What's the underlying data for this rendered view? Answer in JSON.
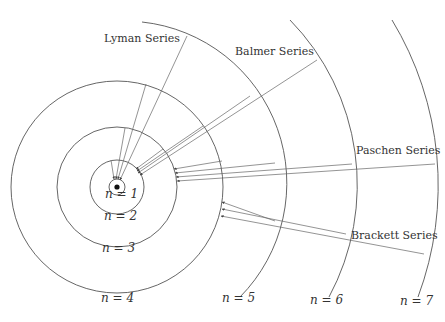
{
  "center": {
    "x": 117,
    "y": 187
  },
  "colors": {
    "line": "#555555",
    "text": "#333333",
    "nucleus": "#111111"
  },
  "levels": [
    {
      "n": 1,
      "label": "n = 1",
      "radius": 8,
      "type": "circle",
      "label_pos": {
        "x": 105,
        "y": 196
      }
    },
    {
      "n": 2,
      "label": "n = 2",
      "radius": 27,
      "type": "circle",
      "label_pos": {
        "x": 104,
        "y": 218
      }
    },
    {
      "n": 3,
      "label": "n = 3",
      "radius": 60,
      "type": "circle",
      "label_pos": {
        "x": 102,
        "y": 250
      }
    },
    {
      "n": 4,
      "label": "n = 4",
      "radius": 106,
      "type": "circle",
      "label_pos": {
        "x": 101,
        "y": 300
      }
    },
    {
      "n": 5,
      "label": "n = 5",
      "radius": 162,
      "type": "arc",
      "arc": {
        "x1": 142,
        "y1": 22,
        "x2": 240,
        "y2": 297
      },
      "label_pos": {
        "x": 222,
        "y": 300
      }
    },
    {
      "n": 6,
      "label": "n = 6",
      "radius": 236,
      "type": "arc",
      "arc": {
        "x1": 290,
        "y1": 20,
        "x2": 329,
        "y2": 297
      },
      "label_pos": {
        "x": 310,
        "y": 302
      }
    },
    {
      "n": 7,
      "label": "n = 7",
      "radius": 319,
      "type": "arc",
      "arc": {
        "x1": 392,
        "y1": 20,
        "x2": 418,
        "y2": 297
      },
      "label_pos": {
        "x": 400,
        "y": 303
      }
    }
  ],
  "series": [
    {
      "name": "Lyman Series",
      "final_level": 1,
      "label_pos": {
        "x": 104,
        "y": 40
      },
      "transitions": [
        {
          "from": 2,
          "x1": 111,
          "y1": 160,
          "x2": 114,
          "y2": 179
        },
        {
          "from": 3,
          "x1": 125,
          "y1": 128,
          "x2": 116,
          "y2": 179
        },
        {
          "from": 4,
          "x1": 146,
          "y1": 84,
          "x2": 118,
          "y2": 179
        },
        {
          "from": 5,
          "x1": 187,
          "y1": 36,
          "x2": 120,
          "y2": 180
        }
      ]
    },
    {
      "name": "Balmer Series",
      "final_level": 2,
      "label_pos": {
        "x": 235,
        "y": 53
      },
      "transitions": [
        {
          "from": 3,
          "x1": 163,
          "y1": 149,
          "x2": 136,
          "y2": 169
        },
        {
          "from": 4,
          "x1": 203,
          "y1": 126,
          "x2": 137,
          "y2": 171
        },
        {
          "from": 5,
          "x1": 250,
          "y1": 96,
          "x2": 138,
          "y2": 173
        },
        {
          "from": 6,
          "x1": 317,
          "y1": 60,
          "x2": 140,
          "y2": 175
        }
      ]
    },
    {
      "name": "Paschen Series",
      "final_level": 3,
      "label_pos": {
        "x": 356,
        "y": 152
      },
      "transitions": [
        {
          "from": 4,
          "x1": 222,
          "y1": 161,
          "x2": 174,
          "y2": 169
        },
        {
          "from": 5,
          "x1": 275,
          "y1": 163,
          "x2": 175,
          "y2": 173
        },
        {
          "from": 6,
          "x1": 352,
          "y1": 164,
          "x2": 176,
          "y2": 177
        },
        {
          "from": 7,
          "x1": 435,
          "y1": 164,
          "x2": 177,
          "y2": 181
        }
      ]
    },
    {
      "name": "Brackett Series",
      "final_level": 4,
      "label_pos": {
        "x": 351,
        "y": 237
      },
      "transitions": [
        {
          "from": 5,
          "x1": 275,
          "y1": 221,
          "x2": 222,
          "y2": 202
        },
        {
          "from": 6,
          "x1": 346,
          "y1": 234,
          "x2": 222,
          "y2": 209
        },
        {
          "from": 7,
          "x1": 424,
          "y1": 254,
          "x2": 221,
          "y2": 216
        }
      ]
    }
  ]
}
